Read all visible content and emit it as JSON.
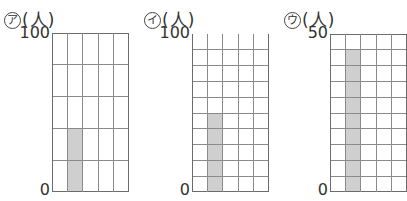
{
  "chart_data": [
    {
      "type": "bar",
      "id": "a",
      "label_symbol": "ア",
      "unit": "(人)",
      "title": "ア (人)",
      "ylim": [
        0,
        100
      ],
      "y_tick_labels": [
        "0",
        "100"
      ],
      "rows": 5,
      "cols": 5,
      "row_value": 20,
      "categories": [
        "col1",
        "col2",
        "col3",
        "col4",
        "col5"
      ],
      "values": [
        0,
        40,
        0,
        0,
        0
      ],
      "bar_column": 2,
      "bar_value": 40,
      "bar_color": "#cfcfcf",
      "grid": true,
      "top_border": true
    },
    {
      "type": "bar",
      "id": "i",
      "label_symbol": "イ",
      "unit": "(人)",
      "title": "イ (人)",
      "ylim": [
        0,
        100
      ],
      "y_tick_labels": [
        "0",
        "100"
      ],
      "rows": 10,
      "cols": 5,
      "row_value": 10,
      "categories": [
        "col1",
        "col2",
        "col3",
        "col4",
        "col5"
      ],
      "values": [
        0,
        50,
        0,
        0,
        0
      ],
      "bar_column": 2,
      "bar_value": 50,
      "bar_color": "#cfcfcf",
      "grid": true,
      "top_border": false
    },
    {
      "type": "bar",
      "id": "u",
      "label_symbol": "ウ",
      "unit": "(人)",
      "title": "ウ (人)",
      "ylim": [
        0,
        50
      ],
      "y_tick_labels": [
        "0",
        "50"
      ],
      "rows": 10,
      "cols": 5,
      "row_value": 5,
      "categories": [
        "col1",
        "col2",
        "col3",
        "col4",
        "col5"
      ],
      "values": [
        0,
        45,
        0,
        0,
        0
      ],
      "bar_column": 2,
      "bar_value": 45,
      "bar_color": "#cfcfcf",
      "grid": true,
      "top_border": true
    }
  ],
  "charts": [
    {
      "symbol": "ア",
      "unit": "(人)",
      "ymax": "100",
      "ymin": "0"
    },
    {
      "symbol": "イ",
      "unit": "(人)",
      "ymax": "100",
      "ymin": "0"
    },
    {
      "symbol": "ウ",
      "unit": "(人)",
      "ymax": "50",
      "ymin": "0"
    }
  ]
}
